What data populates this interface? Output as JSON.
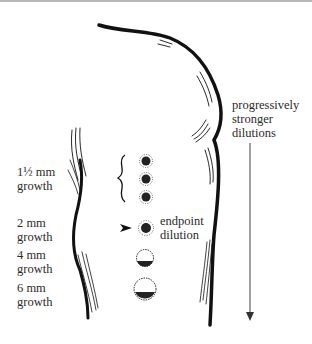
{
  "figure": {
    "growth_labels": [
      {
        "line1": "1½ mm",
        "line2": "growth"
      },
      {
        "line1": "2 mm",
        "line2": "growth"
      },
      {
        "line1": "4 mm",
        "line2": "growth"
      },
      {
        "line1": "6 mm",
        "line2": "growth"
      }
    ],
    "endpoint_label": {
      "line1": "endpoint",
      "line2": "dilution"
    },
    "direction_label": {
      "line1": "progressively",
      "line2": "stronger",
      "line3": "dilutions"
    },
    "wheals": [
      {
        "group": "1½ mm",
        "count": 3
      },
      {
        "group": "2 mm",
        "count": 1,
        "marked": "endpoint"
      },
      {
        "group": "4 mm",
        "count": 1
      },
      {
        "group": "6 mm",
        "count": 1
      }
    ],
    "colors": {
      "ink": "#111111",
      "text": "#2a2a2a",
      "border": "#b8b8b8"
    }
  }
}
